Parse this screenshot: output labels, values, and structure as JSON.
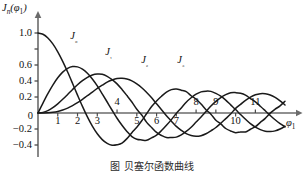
{
  "chart_data": {
    "type": "line",
    "title": "",
    "xlabel": "φ₁",
    "ylabel": "Jₙ(φ₁)",
    "xlim": [
      0,
      12.6
    ],
    "ylim": [
      -0.5,
      1.12
    ],
    "grid": false,
    "legend_position": "inline-curve-labels",
    "xticks": [
      1,
      2,
      3,
      4,
      5,
      6,
      7,
      8,
      9,
      10,
      11
    ],
    "xtick_labels": [
      "1",
      "2",
      "3",
      "4",
      "5",
      "6",
      "7",
      "8",
      "9",
      "10",
      "11"
    ],
    "xtick_above_axis": [
      4,
      8,
      9,
      11
    ],
    "yticks": [
      -0.4,
      -0.2,
      0,
      0.2,
      0.4,
      0.6,
      0.8,
      1.0
    ],
    "ytick_labels": [
      "-0.4",
      "-0.2",
      "0",
      "0.2",
      "0.4",
      "0.6",
      "0.8",
      "1.0"
    ],
    "ytick_labels_hidden": [
      "0.8"
    ],
    "origin_label": "0",
    "series": [
      {
        "name": "J0",
        "label": "J₀",
        "color": "#1a1a1a",
        "x": [
          0,
          0.25,
          0.5,
          0.75,
          1,
          1.25,
          1.5,
          1.75,
          2,
          2.25,
          2.5,
          2.75,
          3,
          3.25,
          3.5,
          3.75,
          4,
          4.25,
          4.5,
          4.75,
          5,
          5.25,
          5.5,
          5.75,
          6,
          6.25,
          6.5,
          6.75,
          7,
          7.25,
          7.5,
          7.75,
          8,
          8.25,
          8.5,
          8.75,
          9,
          9.25,
          9.5,
          9.75,
          10,
          10.25,
          10.5,
          10.75,
          11,
          11.25,
          11.5,
          11.75,
          12,
          12.25,
          12.5
        ],
        "y": [
          1,
          0.9844,
          0.9385,
          0.8642,
          0.7652,
          0.6459,
          0.5118,
          0.369,
          0.2239,
          0.0827,
          -0.0484,
          -0.1641,
          -0.2601,
          -0.3325,
          -0.3801,
          -0.4026,
          -0.3971,
          -0.3766,
          -0.3205,
          -0.2459,
          -0.1776,
          -0.0968,
          -0.0068,
          0.0802,
          0.1506,
          0.2095,
          0.2601,
          0.2921,
          0.3001,
          0.2851,
          0.2663,
          0.216,
          0.1717,
          0.1128,
          0.0419,
          -0.0142,
          -0.0903,
          -0.1367,
          -0.1939,
          -0.2243,
          -0.2459,
          -0.2366,
          -0.2366,
          -0.203,
          -0.1712,
          -0.1181,
          -0.0677,
          -0.0015,
          0.0477,
          0.0896,
          0.1469
        ]
      },
      {
        "name": "J1",
        "label": "J₁",
        "color": "#1a1a1a",
        "x": [
          0,
          0.25,
          0.5,
          0.75,
          1,
          1.25,
          1.5,
          1.75,
          2,
          2.25,
          2.5,
          2.75,
          3,
          3.25,
          3.5,
          3.75,
          4,
          4.25,
          4.5,
          4.75,
          5,
          5.25,
          5.5,
          5.75,
          6,
          6.25,
          6.5,
          6.75,
          7,
          7.25,
          7.5,
          7.75,
          8,
          8.25,
          8.5,
          8.75,
          9,
          9.25,
          9.5,
          9.75,
          10,
          10.25,
          10.5,
          10.75,
          11,
          11.25,
          11.5,
          11.75,
          12,
          12.25,
          12.5
        ],
        "y": [
          0,
          0.124,
          0.2423,
          0.3492,
          0.4401,
          0.5106,
          0.5579,
          0.5802,
          0.5767,
          0.5484,
          0.4971,
          0.4256,
          0.3391,
          0.2403,
          0.1374,
          0.0345,
          -0.066,
          -0.1538,
          -0.2311,
          -0.2943,
          -0.3276,
          -0.3371,
          -0.3414,
          -0.311,
          -0.2767,
          -0.2196,
          -0.1538,
          -0.0826,
          -0.0047,
          0.0629,
          0.1352,
          0.1905,
          0.2346,
          0.2641,
          0.2731,
          0.2702,
          0.2453,
          0.2097,
          0.1613,
          0.1017,
          0.0435,
          -0.0197,
          -0.0789,
          -0.1337,
          -0.1768,
          -0.2078,
          -0.2284,
          -0.232,
          -0.2234,
          -0.2,
          -0.1655
        ]
      },
      {
        "name": "J2",
        "label": "J₂",
        "color": "#1a1a1a",
        "x": [
          0,
          0.25,
          0.5,
          0.75,
          1,
          1.25,
          1.5,
          1.75,
          2,
          2.25,
          2.5,
          2.75,
          3,
          3.25,
          3.5,
          3.75,
          4,
          4.25,
          4.5,
          4.75,
          5,
          5.25,
          5.5,
          5.75,
          6,
          6.25,
          6.5,
          6.75,
          7,
          7.25,
          7.5,
          7.75,
          8,
          8.25,
          8.5,
          8.75,
          9,
          9.25,
          9.5,
          9.75,
          10,
          10.25,
          10.5,
          10.75,
          11,
          11.25,
          11.5,
          11.75,
          12,
          12.25,
          12.5
        ],
        "y": [
          0,
          0.0078,
          0.0306,
          0.0673,
          0.1149,
          0.1711,
          0.2321,
          0.294,
          0.3528,
          0.4046,
          0.4461,
          0.4746,
          0.4861,
          0.4831,
          0.4586,
          0.4169,
          0.3641,
          0.2945,
          0.2178,
          0.1379,
          0.0466,
          -0.0258,
          -0.1173,
          -0.1807,
          -0.2429,
          -0.2811,
          -0.3074,
          -0.3064,
          -0.3014,
          -0.2737,
          -0.2303,
          -0.1776,
          -0.113,
          -0.0491,
          0.0184,
          0.0862,
          0.1448,
          0.1935,
          0.23,
          0.2529,
          0.2546,
          0.2461,
          0.2235,
          0.1806,
          0.139,
          0.085,
          0.028,
          -0.03,
          -0.0849,
          -0.1323,
          -0.173
        ]
      },
      {
        "name": "J3",
        "label": "J₃",
        "color": "#1a1a1a",
        "x": [
          0,
          0.25,
          0.5,
          0.75,
          1,
          1.25,
          1.5,
          1.75,
          2,
          2.25,
          2.5,
          2.75,
          3,
          3.25,
          3.5,
          3.75,
          4,
          4.25,
          4.5,
          4.75,
          5,
          5.25,
          5.5,
          5.75,
          6,
          6.25,
          6.5,
          6.75,
          7,
          7.25,
          7.5,
          7.75,
          8,
          8.25,
          8.5,
          8.75,
          9,
          9.25,
          9.5,
          9.75,
          10,
          10.25,
          10.5,
          10.75,
          11,
          11.25,
          11.5,
          11.75,
          12,
          12.25,
          12.5
        ],
        "y": [
          0,
          0.0003,
          0.0026,
          0.0085,
          0.0196,
          0.0369,
          0.061,
          0.092,
          0.1289,
          0.1704,
          0.2166,
          0.261,
          0.3091,
          0.347,
          0.3869,
          0.4127,
          0.4302,
          0.4333,
          0.4247,
          0.4022,
          0.3648,
          0.316,
          0.2561,
          0.1904,
          0.1148,
          0.0414,
          -0.0353,
          -0.1017,
          -0.1676,
          -0.2169,
          -0.2581,
          -0.2821,
          -0.2911,
          -0.2834,
          -0.2599,
          -0.2226,
          -0.1809,
          -0.1275,
          -0.0701,
          -0.0123,
          0.0583,
          0.108,
          0.1583,
          0.1988,
          0.2273,
          0.2414,
          0.2406,
          0.2253,
          0.1947,
          0.1519,
          0.1003
        ]
      }
    ],
    "curve_label_positions": [
      {
        "name": "J0",
        "x": 1.63,
        "y": 0.955
      },
      {
        "name": "J1",
        "x": 3.4,
        "y": 0.745
      },
      {
        "name": "J2",
        "x": 5.22,
        "y": 0.645
      },
      {
        "name": "J3",
        "x": 7.05,
        "y": 0.645
      }
    ]
  },
  "caption": {
    "text": "图  贝塞尔函数曲线"
  }
}
